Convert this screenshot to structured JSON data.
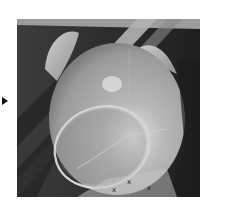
{
  "viewport": {
    "name": "3d-model-viewport",
    "render_mode": "grayscale-shaded",
    "colors": {
      "background_dark": "#2e2e2e",
      "band_light": "#bdbdbd",
      "dome": "#a8a8a8",
      "dome_highlight": "#e6e6e6",
      "ear": "#b8b8b8",
      "ring": "#d0d0d0",
      "frame_border": "#ffffff"
    }
  },
  "pointer": {
    "icon": "triangle-right-icon"
  },
  "axis_labels": [
    {
      "text": "x"
    },
    {
      "text": "x"
    },
    {
      "text": "x"
    }
  ]
}
